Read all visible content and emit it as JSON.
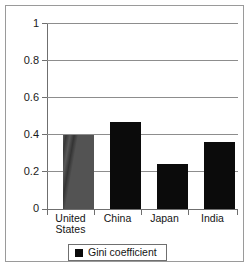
{
  "chart_data": {
    "type": "bar",
    "title": "",
    "subtitle": "",
    "xlabel": "",
    "ylabel": "",
    "categories": [
      "United\nStates",
      "China",
      "Japan",
      "India"
    ],
    "values": [
      0.4,
      0.47,
      0.24,
      0.36
    ],
    "series": [
      {
        "name": "Gini coefficient",
        "values": [
          0.4,
          0.47,
          0.24,
          0.36
        ]
      }
    ],
    "ylim": [
      0,
      1
    ],
    "ytick_labels": [
      "1",
      "0.8",
      "0.6",
      "0.4",
      "0.2",
      "0"
    ],
    "ytick_values": [
      1,
      0.8,
      0.6,
      0.4,
      0.2,
      0
    ],
    "grid": true,
    "legend": {
      "position": "bottom",
      "entries": [
        {
          "label": "Gini coefficient",
          "color": "#0b0b0b",
          "marker": "square"
        }
      ]
    },
    "colors": {
      "bar": "#0b0b0b",
      "bar_highlight": "#4a4a4a",
      "grid": "#8d8d8d",
      "axis": "#6f6f6f",
      "frame": "#9a9a9a",
      "text": "#141414",
      "background": "#ffffff"
    }
  }
}
